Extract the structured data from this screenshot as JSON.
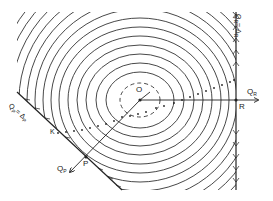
{
  "diagram": {
    "center_label": "O",
    "axis_r": {
      "label": "Q",
      "sub": "R"
    },
    "axis_p": {
      "label": "Q",
      "sub": "P"
    },
    "point_r": "R",
    "point_p": "P",
    "point_k": "K",
    "constraint_r": {
      "label": "Q",
      "sub": "R",
      "rest": "= Δ",
      "rest_sub": "R"
    },
    "constraint_p": {
      "label": "Q",
      "sub": "P",
      "rest": "= Δ",
      "rest_sub": "P"
    }
  },
  "colors": {
    "ink": "#222222",
    "background": "#ffffff"
  }
}
